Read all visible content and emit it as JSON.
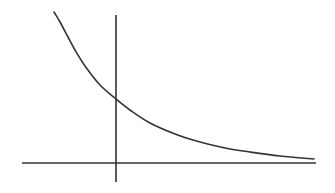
{
  "chart_data": {
    "type": "line",
    "title": "",
    "xlabel": "",
    "ylabel": "",
    "grid": false,
    "legend": null,
    "function": "exponential_decay",
    "series": [
      {
        "name": "decay curve",
        "pixel_points": [
          [
            54,
            12
          ],
          [
            60,
            22
          ],
          [
            68,
            37
          ],
          [
            75,
            50
          ],
          [
            85,
            66
          ],
          [
            100,
            85
          ],
          [
            116,
            99
          ],
          [
            130,
            110
          ],
          [
            150,
            123
          ],
          [
            175,
            134
          ],
          [
            200,
            142
          ],
          [
            230,
            149
          ],
          [
            250,
            152
          ],
          [
            280,
            156
          ],
          [
            314,
            159
          ]
        ]
      }
    ],
    "axes": {
      "x_axis": {
        "x1": 22,
        "y": 163,
        "x2": 316
      },
      "y_axis": {
        "x": 116,
        "y1": 15,
        "y2": 182
      },
      "origin_px": [
        116,
        163
      ],
      "y_intercept_px": [
        116,
        99
      ]
    },
    "colors": {
      "curve": "#333333",
      "axes": "#333333",
      "background": "#ffffff"
    }
  }
}
